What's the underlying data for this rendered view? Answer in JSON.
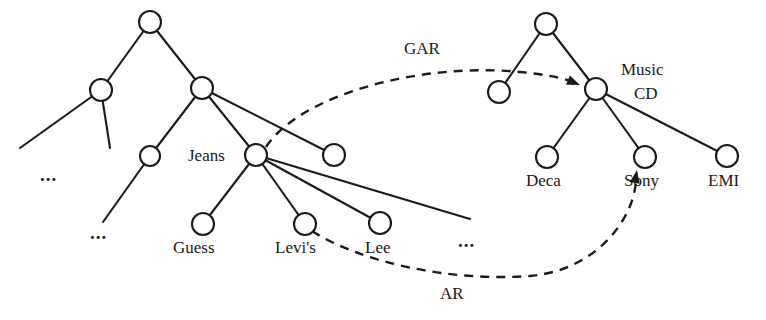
{
  "figure": {
    "type": "concept-hierarchy-diagram",
    "stroke_color": "#1a1a1a",
    "node_fill": "#ffffff",
    "background": "#ffffff"
  },
  "left_tree": {
    "name": "clothing-hierarchy",
    "nodes": [
      {
        "id": "L-root",
        "label": "",
        "cx": 150,
        "cy": 22,
        "r": 11
      },
      {
        "id": "L-a",
        "label": "",
        "cx": 101,
        "cy": 90,
        "r": 11
      },
      {
        "id": "L-b",
        "label": "",
        "cx": 202,
        "cy": 88,
        "r": 11
      },
      {
        "id": "L-c",
        "label": "",
        "cx": 150,
        "cy": 156,
        "r": 10
      },
      {
        "id": "L-jeans",
        "label": "Jeans",
        "cx": 256,
        "cy": 155,
        "r": 11
      },
      {
        "id": "L-sib",
        "label": "",
        "cx": 334,
        "cy": 155,
        "r": 11
      },
      {
        "id": "L-guess",
        "label": "Guess",
        "cx": 203,
        "cy": 224,
        "r": 11
      },
      {
        "id": "L-levis",
        "label": "Levi's",
        "cx": 305,
        "cy": 224,
        "r": 11
      },
      {
        "id": "L-lee",
        "label": "Lee",
        "cx": 380,
        "cy": 223,
        "r": 11
      }
    ],
    "labels": [
      {
        "text": "Jeans",
        "x": 188,
        "y": 147,
        "align": "left"
      },
      {
        "text": "Guess",
        "x": 173,
        "y": 239,
        "align": "left"
      },
      {
        "text": "Levi's",
        "x": 275,
        "y": 239,
        "align": "left"
      },
      {
        "text": "Lee",
        "x": 365,
        "y": 239,
        "align": "left"
      }
    ],
    "ellipses": [
      {
        "text": "...",
        "x": 40,
        "y": 166
      },
      {
        "text": "...",
        "x": 90,
        "y": 224
      },
      {
        "text": "...",
        "x": 458,
        "y": 232
      }
    ],
    "edges": [
      {
        "from": "L-root",
        "to": "L-a"
      },
      {
        "from": "L-root",
        "to": "L-b"
      },
      {
        "from": "L-b",
        "to": "L-c"
      },
      {
        "from": "L-b",
        "to": "L-jeans"
      },
      {
        "from": "L-b",
        "to": "L-sib"
      },
      {
        "from": "L-jeans",
        "to": "L-guess"
      },
      {
        "from": "L-jeans",
        "to": "L-levis"
      },
      {
        "from": "L-jeans",
        "to": "L-lee"
      }
    ],
    "open_edges": [
      {
        "from": "L-a",
        "x2": 20,
        "y2": 148
      },
      {
        "from": "L-a",
        "x2": 110,
        "y2": 148
      },
      {
        "from": "L-c",
        "x2": 103,
        "y2": 222
      },
      {
        "from": "L-jeans",
        "x2": 470,
        "y2": 219
      }
    ]
  },
  "right_tree": {
    "name": "music-cd-hierarchy",
    "nodes": [
      {
        "id": "R-root",
        "label": "",
        "cx": 546,
        "cy": 24,
        "r": 11
      },
      {
        "id": "R-a",
        "label": "",
        "cx": 499,
        "cy": 92,
        "r": 11
      },
      {
        "id": "R-musiccd",
        "label": "Music CD",
        "cx": 596,
        "cy": 89,
        "r": 11
      },
      {
        "id": "R-deca",
        "label": "Deca",
        "cx": 547,
        "cy": 157,
        "r": 11
      },
      {
        "id": "R-sony",
        "label": "Sony",
        "cx": 645,
        "cy": 157,
        "r": 11
      },
      {
        "id": "R-emi",
        "label": "EMI",
        "cx": 727,
        "cy": 156,
        "r": 11
      }
    ],
    "labels": [
      {
        "text": "Music",
        "x": 621,
        "y": 61,
        "align": "left"
      },
      {
        "text": "CD",
        "x": 634,
        "y": 85,
        "align": "left"
      },
      {
        "text": "Deca",
        "x": 526,
        "y": 172,
        "align": "left"
      },
      {
        "text": "Sony",
        "x": 624,
        "y": 172,
        "align": "left"
      },
      {
        "text": "EMI",
        "x": 708,
        "y": 172,
        "align": "left"
      }
    ],
    "edges": [
      {
        "from": "R-root",
        "to": "R-a"
      },
      {
        "from": "R-root",
        "to": "R-musiccd"
      },
      {
        "from": "R-musiccd",
        "to": "R-deca"
      },
      {
        "from": "R-musiccd",
        "to": "R-sony"
      },
      {
        "from": "R-musiccd",
        "to": "R-emi"
      }
    ]
  },
  "relations": [
    {
      "id": "gar",
      "label": "GAR",
      "label_x": 404,
      "label_y": 40,
      "style": "dashed",
      "from_node": "L-jeans",
      "to_node": "R-musiccd",
      "path": "M 266 147 C 300 95, 420 62, 520 72 C 552 75, 570 80, 578 84",
      "arrow_at": {
        "x": 580,
        "y": 85,
        "angle": 22
      }
    },
    {
      "id": "ar",
      "label": "AR",
      "label_x": 440,
      "label_y": 285,
      "style": "dashed",
      "from_node": "L-levis",
      "to_node": "R-sony",
      "path": "M 312 231 C 360 262, 450 282, 530 276 C 600 270, 636 214, 636 178",
      "arrow_at": {
        "x": 637,
        "y": 170,
        "angle": -80
      }
    }
  ]
}
